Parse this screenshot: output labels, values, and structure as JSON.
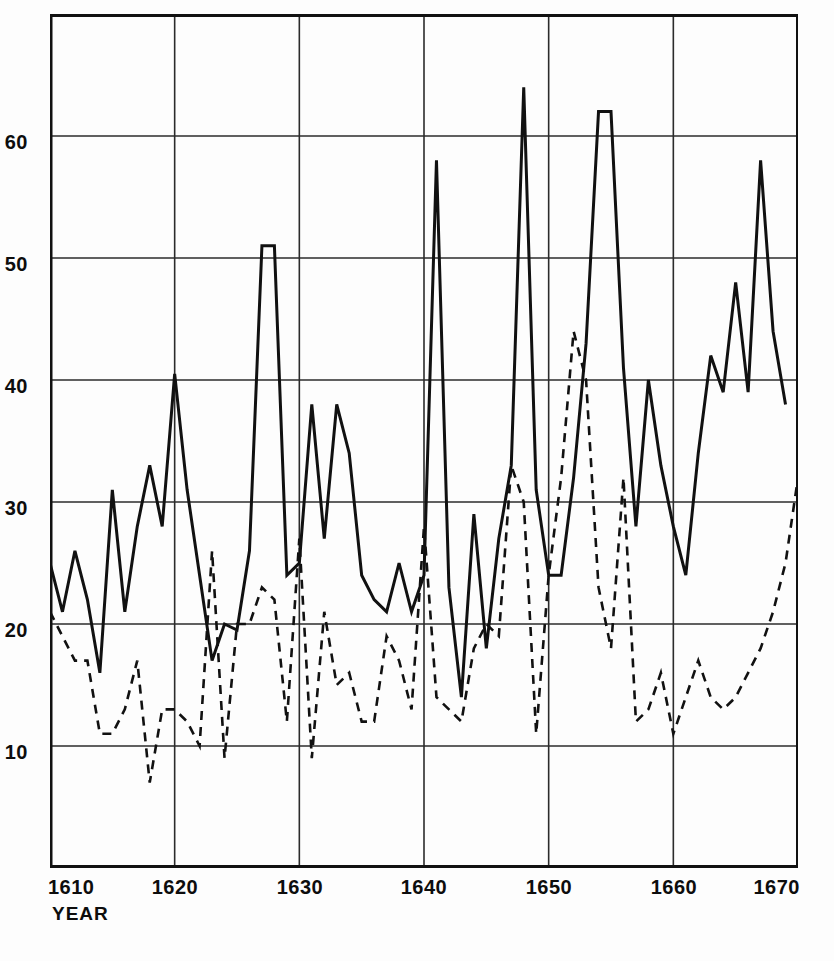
{
  "chart_data": {
    "type": "line",
    "title": "",
    "subtitle": "",
    "xlabel": "YEAR",
    "ylabel": "",
    "xlim": [
      1610,
      1670
    ],
    "ylim": [
      0,
      70
    ],
    "xticks": [
      1610,
      1620,
      1630,
      1640,
      1650,
      1660,
      1670
    ],
    "yticks": [
      10,
      20,
      30,
      40,
      50,
      60
    ],
    "grid": true,
    "legend_position": "none",
    "x": [
      1610,
      1611,
      1612,
      1613,
      1614,
      1615,
      1616,
      1617,
      1618,
      1619,
      1620,
      1621,
      1622,
      1623,
      1624,
      1625,
      1626,
      1627,
      1628,
      1629,
      1630,
      1631,
      1632,
      1633,
      1634,
      1635,
      1636,
      1637,
      1638,
      1639,
      1640,
      1641,
      1642,
      1643,
      1644,
      1645,
      1646,
      1647,
      1648,
      1649,
      1650,
      1651,
      1652,
      1653,
      1654,
      1655,
      1656,
      1657,
      1658,
      1659,
      1660,
      1661,
      1662,
      1663,
      1664,
      1665,
      1666,
      1667,
      1668,
      1669,
      1670
    ],
    "series": [
      {
        "name": "solid-series",
        "style": "solid",
        "color": "#111111",
        "values": [
          25,
          21,
          26,
          22,
          16,
          31,
          21,
          28,
          33,
          28,
          40.5,
          31,
          24,
          17,
          20,
          19.5,
          26,
          51,
          51,
          24,
          25,
          38,
          27,
          38,
          34,
          24,
          22,
          21,
          25,
          21,
          24,
          58,
          23,
          14,
          29,
          18,
          27,
          33,
          64,
          31,
          24,
          24,
          32,
          43,
          62,
          62,
          41,
          28,
          40,
          33,
          28,
          24,
          34,
          42,
          39,
          48,
          39,
          58,
          44,
          38,
          null
        ]
      },
      {
        "name": "dashed-series",
        "style": "dashed",
        "color": "#111111",
        "values": [
          21,
          19,
          17,
          17,
          11,
          11,
          13,
          17,
          7,
          13,
          13,
          12,
          10,
          26,
          9,
          20,
          20,
          23,
          22,
          12,
          27,
          9,
          21,
          15,
          16,
          12,
          12,
          19,
          17,
          13,
          28,
          14,
          13,
          12,
          18,
          20,
          19,
          33,
          30,
          11,
          24,
          32,
          44,
          40,
          23,
          18,
          32,
          12,
          13,
          16,
          11,
          14,
          17,
          14,
          13,
          14,
          16,
          18,
          21,
          25,
          32
        ]
      }
    ]
  },
  "axes": {
    "y_tick_labels": [
      "60",
      "50",
      "40",
      "30",
      "20",
      "10"
    ],
    "x_tick_labels": [
      "1610",
      "1620",
      "1630",
      "1640",
      "1650",
      "1660",
      "1670"
    ],
    "x_axis_title": "YEAR"
  },
  "style": {
    "line_color": "#111111",
    "grid_color": "#2b2b2b",
    "frame_color": "#111111",
    "background": "#fdfdfd"
  }
}
